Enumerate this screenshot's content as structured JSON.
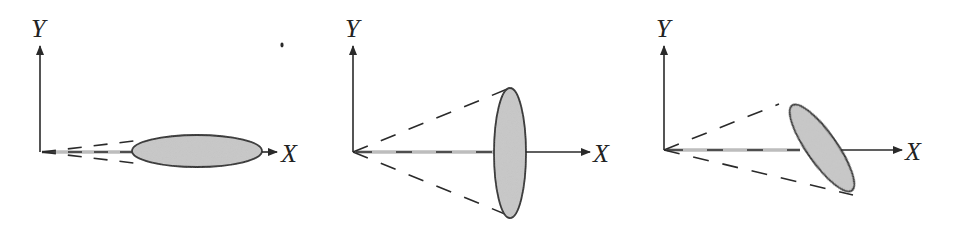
{
  "figure": {
    "colors": {
      "stroke": "#2a2a2a",
      "ellipse_fill": "#c8c8c8",
      "beam_dash": "#bdbdbd",
      "background": "#ffffff"
    },
    "panels": [
      {
        "id": "panel-1",
        "orientation": "edge-on (disc lies along X axis)",
        "y_label": "Y",
        "x_label": "X"
      },
      {
        "id": "panel-2",
        "orientation": "face-on (disc perpendicular to X axis)",
        "y_label": "Y",
        "x_label": "X"
      },
      {
        "id": "panel-3",
        "orientation": "tilted (disc inclined to X axis)",
        "y_label": "Y",
        "x_label": "X"
      }
    ]
  }
}
